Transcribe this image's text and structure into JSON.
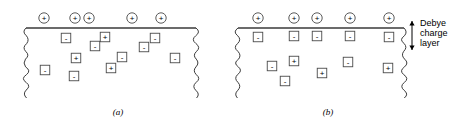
{
  "figure": {
    "width": 464,
    "height": 126,
    "background": "#ffffff",
    "ink_color": "#3a3a3a"
  },
  "annotation": {
    "label_lines": [
      "Debye",
      "charge",
      "layer"
    ],
    "arrow": {
      "name": "double-headed-vertical-arrow",
      "x": 412,
      "y_top": 21,
      "y_bottom": 50
    },
    "text_x": 420,
    "text_y_start": 26,
    "line_height": 10
  },
  "panels": [
    {
      "id": "a",
      "caption": "(a)",
      "caption_x": 118,
      "caption_y": 115,
      "surface": {
        "x1": 26,
        "x2": 196,
        "y": 28
      },
      "left_edge_x": 26,
      "right_edge_x": 196,
      "edge_y_top": 28,
      "edge_y_bottom": 98,
      "surface_charges": [
        {
          "symbol": "+",
          "x": 44,
          "y": 18
        },
        {
          "symbol": "+",
          "x": 75,
          "y": 18
        },
        {
          "symbol": "+",
          "x": 89,
          "y": 18
        },
        {
          "symbol": "+",
          "x": 132,
          "y": 18
        },
        {
          "symbol": "+",
          "x": 161,
          "y": 18
        }
      ],
      "interior_ions": [
        {
          "symbol": "-",
          "x": 66,
          "y": 38
        },
        {
          "symbol": "+",
          "x": 105,
          "y": 37
        },
        {
          "symbol": "-",
          "x": 155,
          "y": 38
        },
        {
          "symbol": "-",
          "x": 95,
          "y": 46
        },
        {
          "symbol": "-",
          "x": 144,
          "y": 47
        },
        {
          "symbol": "+",
          "x": 76,
          "y": 58
        },
        {
          "symbol": "-",
          "x": 122,
          "y": 57
        },
        {
          "symbol": "-",
          "x": 175,
          "y": 58
        },
        {
          "symbol": "+",
          "x": 111,
          "y": 68
        },
        {
          "symbol": "-",
          "x": 45,
          "y": 70
        },
        {
          "symbol": "-",
          "x": 74,
          "y": 76
        }
      ]
    },
    {
      "id": "b",
      "caption": "(b)",
      "caption_x": 328,
      "caption_y": 115,
      "surface": {
        "x1": 238,
        "x2": 404,
        "y": 28
      },
      "left_edge_x": 238,
      "right_edge_x": 404,
      "edge_y_top": 28,
      "edge_y_bottom": 98,
      "surface_charges": [
        {
          "symbol": "+",
          "x": 258,
          "y": 18
        },
        {
          "symbol": "+",
          "x": 294,
          "y": 18
        },
        {
          "symbol": "+",
          "x": 317,
          "y": 18
        },
        {
          "symbol": "+",
          "x": 350,
          "y": 18
        },
        {
          "symbol": "+",
          "x": 389,
          "y": 18
        }
      ],
      "layer_ions": [
        {
          "symbol": "-",
          "x": 258,
          "y": 37
        },
        {
          "symbol": "-",
          "x": 294,
          "y": 36
        },
        {
          "symbol": "-",
          "x": 317,
          "y": 36
        },
        {
          "symbol": "-",
          "x": 350,
          "y": 36
        },
        {
          "symbol": "-",
          "x": 389,
          "y": 37
        }
      ],
      "interior_ions": [
        {
          "symbol": "+",
          "x": 294,
          "y": 61
        },
        {
          "symbol": "-",
          "x": 272,
          "y": 66
        },
        {
          "symbol": "-",
          "x": 348,
          "y": 62
        },
        {
          "symbol": "+",
          "x": 388,
          "y": 68
        },
        {
          "symbol": "+",
          "x": 322,
          "y": 73
        },
        {
          "symbol": "-",
          "x": 285,
          "y": 81
        }
      ]
    }
  ],
  "geometry": {
    "circle_radius": 5.2,
    "box_size": 9.5
  }
}
